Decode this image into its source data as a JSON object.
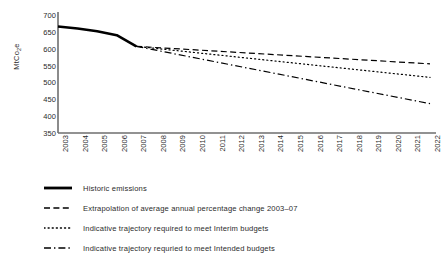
{
  "chart_data": {
    "type": "line",
    "title": "",
    "xlabel": "",
    "ylabel": "MtCo2e",
    "ylabel_parts": {
      "pre": "MtCo",
      "sub": "2",
      "post": "e"
    },
    "ylim": [
      350,
      700
    ],
    "yticks": [
      700,
      650,
      600,
      550,
      500,
      450,
      400,
      350
    ],
    "grid": false,
    "legend_position": "below",
    "x": [
      2003,
      2004,
      2005,
      2006,
      2007,
      2008,
      2009,
      2010,
      2011,
      2012,
      2013,
      2014,
      2015,
      2016,
      2017,
      2018,
      2019,
      2020,
      2021,
      2022
    ],
    "categories": [
      "2003",
      "2004",
      "2005",
      "2006",
      "2007",
      "2008",
      "2009",
      "2010",
      "2011",
      "2012",
      "2013",
      "2014",
      "2015",
      "2016",
      "2017",
      "2018",
      "2019",
      "2020",
      "2021",
      "2022"
    ],
    "series": [
      {
        "name": "Historic emissions",
        "style": "solid",
        "color": "#000000",
        "width": 2.6,
        "x": [
          2003,
          2004,
          2005,
          2006,
          2007
        ],
        "values": [
          666,
          660,
          652,
          640,
          607
        ]
      },
      {
        "name": "Extrapolation of average annual percentage change 2003–07",
        "style": "dashed",
        "color": "#000000",
        "width": 1.2,
        "x": [
          2007,
          2022
        ],
        "values": [
          607,
          555
        ]
      },
      {
        "name": "Indicative trajectory required to meet Interim budgets",
        "style": "dotted",
        "color": "#000000",
        "width": 1.2,
        "x": [
          2007,
          2022
        ],
        "values": [
          607,
          515
        ]
      },
      {
        "name": "Indicative trajectory requried to meet Intended budgets",
        "style": "dashdot",
        "color": "#000000",
        "width": 1.2,
        "x": [
          2007,
          2022
        ],
        "values": [
          607,
          437
        ]
      }
    ]
  },
  "legend": {
    "items": [
      {
        "label": "Historic emissions",
        "style": "solid"
      },
      {
        "label": "Extrapolation of average annual percentage change 2003–07",
        "style": "dashed"
      },
      {
        "label": "Indicative trajectory required to meet Interim budgets",
        "style": "dotted"
      },
      {
        "label": "Indicative trajectory requried to meet Intended budgets",
        "style": "dashdot"
      }
    ]
  },
  "axes": {
    "axis_color": "#6e6e6e"
  }
}
